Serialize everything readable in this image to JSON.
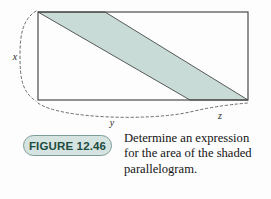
{
  "figure": {
    "badge_label": "FIGURE 12.46",
    "caption_lines": [
      "Determine an expression",
      "for the area of the shaded",
      "parallelogram."
    ],
    "caption_full": "Determine an expression for the area of the shaded parallelogram."
  },
  "diagram": {
    "type": "geometry-figure",
    "dimension_labels": {
      "height": "x",
      "base_left": "y",
      "base_right": "z"
    },
    "colors": {
      "shade_fill": "#c9dbd7",
      "outline": "#555a58",
      "rect_stroke": "#3a3a3a",
      "brace_stroke": "#6b6b6b",
      "badge_fill": "#d6e4e1",
      "badge_border": "#7c9c98",
      "badge_text": "#1d4c42"
    },
    "rectangle": {
      "left": 38,
      "top": 12,
      "right": 248,
      "bottom": 100,
      "width": 210,
      "height": 88
    },
    "parallelogram": {
      "points": "38,12 105,12 248,100 190,100",
      "vertices": [
        {
          "name": "top-left",
          "x": 38,
          "y": 12
        },
        {
          "name": "top-right",
          "x": 105,
          "y": 12
        },
        {
          "name": "bottom-right",
          "x": 248,
          "y": 100
        },
        {
          "name": "bottom-left",
          "x": 190,
          "y": 100
        }
      ]
    },
    "braces": {
      "left_brace_path": "M 36,11 C 22,20 20,36 20,56 C 20,78 22,92 36,101",
      "bottom_brace_path": "M 38,103 C 60,119 150,121 190,112 C 215,106 236,104 248,103",
      "bottom_tick_x": 190
    },
    "label_positions": {
      "x": {
        "x": 15,
        "y": 60
      },
      "y": {
        "x": 112,
        "y": 126
      },
      "z": {
        "x": 220,
        "y": 119
      }
    }
  }
}
